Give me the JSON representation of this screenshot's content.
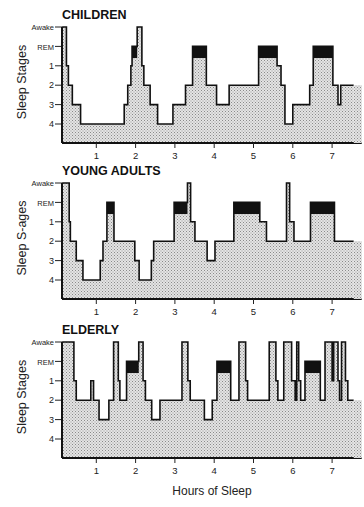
{
  "chart_data": {
    "type": "area",
    "title": "",
    "xlabel": "Hours of Sleep",
    "ylabel": "Sleep Stages",
    "x_ticks": [
      1,
      2,
      3,
      4,
      5,
      6,
      7
    ],
    "xlim": [
      0.13,
      7.75
    ],
    "stage_levels": [
      "Awake",
      "REM",
      "1",
      "2",
      "3",
      "4"
    ],
    "grid": false,
    "legend": null,
    "colors": {
      "fill": "#d9d9d9",
      "line": "#111111",
      "rem": "#111111",
      "stage_band": "#f2f2f2"
    },
    "panels": [
      {
        "title": "CHILDREN",
        "ylabel": "Sleep Stages",
        "hypnogram": [
          [
            0.13,
            "Awake"
          ],
          [
            0.24,
            "1"
          ],
          [
            0.29,
            "2"
          ],
          [
            0.39,
            "3"
          ],
          [
            0.6,
            "4"
          ],
          [
            1.71,
            "3"
          ],
          [
            1.8,
            "2"
          ],
          [
            1.88,
            "1"
          ],
          [
            1.91,
            "REM"
          ],
          [
            2.04,
            "Awake"
          ],
          [
            2.16,
            "1"
          ],
          [
            2.21,
            "2"
          ],
          [
            2.37,
            "3"
          ],
          [
            2.56,
            "4"
          ],
          [
            2.95,
            "3"
          ],
          [
            3.27,
            "2"
          ],
          [
            3.45,
            "REM"
          ],
          [
            3.8,
            "2"
          ],
          [
            4.06,
            "3"
          ],
          [
            4.38,
            "2"
          ],
          [
            5.13,
            "REM"
          ],
          [
            5.6,
            "1"
          ],
          [
            5.7,
            "2"
          ],
          [
            5.8,
            "4"
          ],
          [
            6.0,
            "3"
          ],
          [
            6.43,
            "2"
          ],
          [
            6.52,
            "REM"
          ],
          [
            7.02,
            "2"
          ],
          [
            7.15,
            "3"
          ],
          [
            7.22,
            "2"
          ],
          [
            7.55,
            "end"
          ]
        ],
        "rem_periods": [
          [
            1.91,
            2.04
          ],
          [
            3.45,
            3.8
          ],
          [
            5.13,
            5.6
          ],
          [
            6.52,
            7.02
          ]
        ]
      },
      {
        "title": "YOUNG ADULTS",
        "ylabel": "Sleep S-ages",
        "hypnogram": [
          [
            0.13,
            "Awake"
          ],
          [
            0.31,
            "1"
          ],
          [
            0.34,
            "2"
          ],
          [
            0.49,
            "3"
          ],
          [
            0.66,
            "4"
          ],
          [
            1.1,
            "3"
          ],
          [
            1.17,
            "2"
          ],
          [
            1.27,
            "REM"
          ],
          [
            1.45,
            "2"
          ],
          [
            1.98,
            "3"
          ],
          [
            2.09,
            "4"
          ],
          [
            2.4,
            "3"
          ],
          [
            2.46,
            "2"
          ],
          [
            2.98,
            "REM"
          ],
          [
            3.32,
            "Awake"
          ],
          [
            3.4,
            "1"
          ],
          [
            3.51,
            "2"
          ],
          [
            3.82,
            "3"
          ],
          [
            4.02,
            "2"
          ],
          [
            4.5,
            "REM"
          ],
          [
            5.16,
            "1"
          ],
          [
            5.33,
            "2"
          ],
          [
            5.84,
            "Awake"
          ],
          [
            5.92,
            "1"
          ],
          [
            6.03,
            "2"
          ],
          [
            6.45,
            "REM"
          ],
          [
            7.06,
            "2"
          ],
          [
            7.55,
            "end"
          ]
        ],
        "rem_periods": [
          [
            1.27,
            1.45
          ],
          [
            2.98,
            3.32
          ],
          [
            4.5,
            5.16
          ],
          [
            6.45,
            7.06
          ]
        ]
      },
      {
        "title": "ELDERLY",
        "ylabel": "Sleep Stages",
        "hypnogram": [
          [
            0.13,
            "Awake"
          ],
          [
            0.43,
            "1"
          ],
          [
            0.49,
            "2"
          ],
          [
            0.86,
            "1"
          ],
          [
            0.93,
            "2"
          ],
          [
            1.07,
            "3"
          ],
          [
            1.32,
            "2"
          ],
          [
            1.44,
            "Awake"
          ],
          [
            1.56,
            "1"
          ],
          [
            1.6,
            "2"
          ],
          [
            1.77,
            "REM"
          ],
          [
            2.08,
            "Awake"
          ],
          [
            2.19,
            "1"
          ],
          [
            2.25,
            "2"
          ],
          [
            2.41,
            "3"
          ],
          [
            2.62,
            "2"
          ],
          [
            3.18,
            "Awake"
          ],
          [
            3.33,
            "1"
          ],
          [
            3.39,
            "2"
          ],
          [
            3.75,
            "3"
          ],
          [
            3.95,
            "2"
          ],
          [
            4.07,
            "REM"
          ],
          [
            4.42,
            "2"
          ],
          [
            4.63,
            "Awake"
          ],
          [
            4.8,
            "1"
          ],
          [
            4.85,
            "2"
          ],
          [
            5.4,
            "Awake"
          ],
          [
            5.57,
            "1"
          ],
          [
            5.62,
            "2"
          ],
          [
            5.77,
            "Awake"
          ],
          [
            5.97,
            "1"
          ],
          [
            6.06,
            "2"
          ],
          [
            6.1,
            "Awake"
          ],
          [
            6.15,
            "1"
          ],
          [
            6.2,
            "2"
          ],
          [
            6.31,
            "REM"
          ],
          [
            6.7,
            "2"
          ],
          [
            6.82,
            "Awake"
          ],
          [
            7.0,
            "1"
          ],
          [
            7.04,
            "Awake"
          ],
          [
            7.15,
            "1"
          ],
          [
            7.19,
            "2"
          ],
          [
            7.24,
            "Awake"
          ],
          [
            7.34,
            "1"
          ],
          [
            7.4,
            "2"
          ],
          [
            7.55,
            "end"
          ]
        ],
        "rem_periods": [
          [
            1.77,
            2.08
          ],
          [
            4.07,
            4.42
          ],
          [
            6.31,
            6.7
          ]
        ]
      }
    ]
  }
}
